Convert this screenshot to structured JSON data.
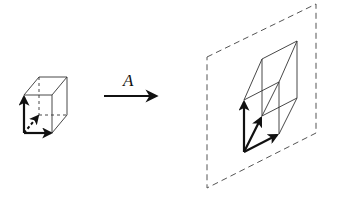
{
  "diagram": {
    "map_label": "A",
    "colors": {
      "stroke": "#111111",
      "thin_stroke": "#333333",
      "plane_stroke": "#555555",
      "background": "#ffffff"
    },
    "left_figure": {
      "name": "unit cube with basis vectors",
      "vectors": [
        "e1 (right)",
        "e2 (up)",
        "e3 (depth, dashed)"
      ]
    },
    "arrow": {
      "label": "A",
      "direction": "right"
    },
    "right_figure": {
      "name": "image of cube (parallelepiped) lying in a dashed plane",
      "vectors": [
        "A e1",
        "A e2",
        "A e3"
      ]
    }
  }
}
